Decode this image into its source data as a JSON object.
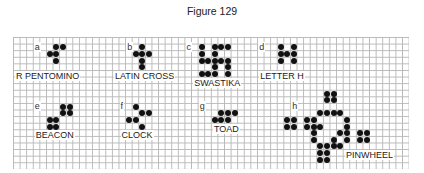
{
  "figure": {
    "title": "Figure 129",
    "grid": {
      "cols": 60,
      "rows": 20,
      "cell": 6.6,
      "line_color": "#b9b9b9",
      "dot_color": "#111111"
    },
    "patterns": [
      {
        "id": "a",
        "name": "R PENTOMINO",
        "letter_pos": [
          3,
          1
        ],
        "label_pos": [
          0,
          5
        ],
        "cells": [
          [
            6,
            1
          ],
          [
            7,
            1
          ],
          [
            5,
            2
          ],
          [
            6,
            2
          ],
          [
            6,
            3
          ]
        ]
      },
      {
        "id": "b",
        "name": "LATIN CROSS",
        "letter_pos": [
          17,
          1
        ],
        "label_pos": [
          15,
          5
        ],
        "cells": [
          [
            19,
            1
          ],
          [
            18,
            2
          ],
          [
            19,
            2
          ],
          [
            20,
            2
          ],
          [
            19,
            3
          ],
          [
            19,
            4
          ]
        ]
      },
      {
        "id": "c",
        "name": "SWASTIKA",
        "letter_pos": [
          26,
          1
        ],
        "label_pos": [
          27,
          6
        ],
        "cells": [
          [
            28,
            1
          ],
          [
            30,
            1
          ],
          [
            31,
            1
          ],
          [
            32,
            1
          ],
          [
            28,
            2
          ],
          [
            30,
            2
          ],
          [
            28,
            3
          ],
          [
            29,
            3
          ],
          [
            30,
            3
          ],
          [
            31,
            3
          ],
          [
            32,
            3
          ],
          [
            30,
            4
          ],
          [
            32,
            4
          ],
          [
            28,
            5
          ],
          [
            29,
            5
          ],
          [
            30,
            5
          ],
          [
            32,
            5
          ]
        ]
      },
      {
        "id": "d",
        "name": "LETTER H",
        "letter_pos": [
          37,
          1
        ],
        "label_pos": [
          37,
          5
        ],
        "cells": [
          [
            40,
            1
          ],
          [
            42,
            1
          ],
          [
            40,
            2
          ],
          [
            41,
            2
          ],
          [
            42,
            2
          ],
          [
            40,
            3
          ],
          [
            42,
            3
          ]
        ]
      },
      {
        "id": "e",
        "name": "BEACON",
        "letter_pos": [
          3,
          10
        ],
        "label_pos": [
          3,
          14
        ],
        "cells": [
          [
            7,
            10
          ],
          [
            8,
            10
          ],
          [
            7,
            11
          ],
          [
            8,
            11
          ],
          [
            5,
            12
          ],
          [
            6,
            12
          ],
          [
            5,
            13
          ],
          [
            6,
            13
          ]
        ]
      },
      {
        "id": "f",
        "name": "CLOCK",
        "letter_pos": [
          16,
          10
        ],
        "label_pos": [
          16,
          14
        ],
        "cells": [
          [
            18,
            10
          ],
          [
            19,
            11
          ],
          [
            20,
            11
          ],
          [
            17,
            12
          ],
          [
            18,
            12
          ],
          [
            19,
            13
          ]
        ]
      },
      {
        "id": "g",
        "name": "TOAD",
        "letter_pos": [
          28,
          10
        ],
        "label_pos": [
          30,
          13
        ],
        "cells": [
          [
            31,
            11
          ],
          [
            32,
            11
          ],
          [
            33,
            11
          ],
          [
            30,
            12
          ],
          [
            31,
            12
          ],
          [
            32,
            12
          ]
        ]
      },
      {
        "id": "h",
        "name": "PINWHEEL",
        "letter_pos": [
          42,
          10
        ],
        "label_pos": [
          50,
          17
        ],
        "cells": [
          [
            47,
            8
          ],
          [
            48,
            8
          ],
          [
            47,
            9
          ],
          [
            48,
            9
          ],
          [
            46,
            11
          ],
          [
            47,
            11
          ],
          [
            48,
            11
          ],
          [
            49,
            11
          ],
          [
            44,
            12
          ],
          [
            45,
            12
          ],
          [
            50,
            12
          ],
          [
            44,
            13
          ],
          [
            45,
            13
          ],
          [
            46,
            13
          ],
          [
            50,
            13
          ],
          [
            45,
            14
          ],
          [
            49,
            14
          ],
          [
            50,
            14
          ],
          [
            45,
            15
          ],
          [
            48,
            15
          ],
          [
            50,
            15
          ],
          [
            46,
            16
          ],
          [
            47,
            16
          ],
          [
            48,
            16
          ],
          [
            49,
            16
          ],
          [
            46,
            17
          ],
          [
            47,
            17
          ],
          [
            46,
            18
          ],
          [
            47,
            18
          ],
          [
            41,
            12
          ],
          [
            42,
            12
          ],
          [
            41,
            13
          ],
          [
            42,
            13
          ],
          [
            52,
            14
          ],
          [
            53,
            14
          ],
          [
            52,
            15
          ],
          [
            53,
            15
          ]
        ]
      }
    ]
  }
}
